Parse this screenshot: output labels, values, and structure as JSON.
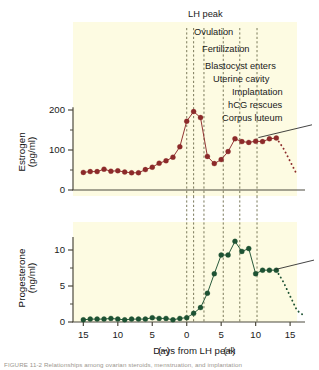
{
  "figure": {
    "background": "#fdfbe2",
    "page_background": "#ffffff",
    "estrogen_color": "#8c2a2a",
    "progesterone_color": "#1d5233",
    "axis_color": "#4d4a3e",
    "annotation_color": "#1a1a1a"
  },
  "annotations": [
    {
      "id": "lh-peak",
      "label": "LH peak",
      "day": 0.0
    },
    {
      "id": "ovulation",
      "label": "Ovulation",
      "day": 1.0
    },
    {
      "id": "fertilization",
      "label": "Fertilization",
      "day": 2.5
    },
    {
      "id": "blastocyst",
      "label": "Blastocyst enters",
      "day": 5.3
    },
    {
      "id": "uterine-cavity",
      "label": "Uterine cavity",
      "day": 5.3
    },
    {
      "id": "implantation",
      "label": "Implantation",
      "day": 7.7
    },
    {
      "id": "hcg-rescues",
      "label": "hCG rescues",
      "day": 10.2
    },
    {
      "id": "corpus-luteum",
      "label": "Corpus luteum",
      "day": 10.2
    }
  ],
  "xaxis": {
    "label_main": "Days from LH peak",
    "label_minus": "(−)",
    "label_plus": "(+)",
    "ticks": [
      {
        "value": -15,
        "text": "15"
      },
      {
        "value": -10,
        "text": "10"
      },
      {
        "value": -5,
        "text": "5"
      },
      {
        "value": 0,
        "text": "0"
      },
      {
        "value": 5,
        "text": "5"
      },
      {
        "value": 10,
        "text": "10"
      },
      {
        "value": 15,
        "text": "15"
      }
    ],
    "range": [
      -16.5,
      16.0
    ]
  },
  "chart_data": [
    {
      "id": "estrogen-panel",
      "type": "line",
      "title": "",
      "xlabel": "Days from LH peak",
      "ylabel": "Estrogen (pg/ml)",
      "ylabel_lines": [
        "Estrogen",
        "(pg/ml)"
      ],
      "series_name": "Estrogen",
      "color": "#8c2a2a",
      "ylim": [
        0,
        215
      ],
      "yticks": [
        0,
        100,
        200
      ],
      "ytick_labels": [
        "0",
        "100",
        "200"
      ],
      "grid": false,
      "legend": "none",
      "x": [
        -15,
        -14,
        -13,
        -12,
        -11,
        -10,
        -9,
        -8,
        -7,
        -6,
        -5,
        -4,
        -3,
        -2,
        -1,
        0,
        1,
        2,
        3,
        4,
        5,
        6,
        7,
        8,
        9,
        10,
        11,
        12,
        13
      ],
      "values": [
        44,
        46,
        46,
        52,
        47,
        48,
        45,
        43,
        43,
        51,
        57,
        67,
        73,
        82,
        108,
        172,
        196,
        181,
        84,
        66,
        76,
        96,
        128,
        121,
        119,
        122,
        121,
        128,
        130
      ],
      "dotted_tail": {
        "x": [
          13,
          14,
          15,
          16
        ],
        "values": [
          130,
          105,
          72,
          38
        ],
        "style": "dotted"
      }
    },
    {
      "id": "progesterone-panel",
      "type": "line",
      "title": "",
      "xlabel": "Days from LH peak",
      "ylabel": "Progesterone (ng/ml)",
      "ylabel_lines": [
        "Progesterone",
        "(ng/ml)"
      ],
      "series_name": "Progesterone",
      "color": "#1d5233",
      "ylim": [
        0,
        12.2
      ],
      "yticks": [
        0,
        5,
        10
      ],
      "ytick_labels": [
        "0",
        "5",
        "10"
      ],
      "yticks_minor": [
        2.5,
        7.5
      ],
      "grid": false,
      "legend": "none",
      "x": [
        -15,
        -14,
        -13,
        -12,
        -11,
        -10,
        -9,
        -8,
        -7,
        -6,
        -5,
        -4,
        -3,
        -2,
        -1,
        0,
        1,
        2,
        3,
        4,
        5,
        6,
        7,
        8,
        9,
        10,
        11,
        12,
        13
      ],
      "values": [
        0.3,
        0.4,
        0.4,
        0.4,
        0.5,
        0.4,
        0.3,
        0.4,
        0.4,
        0.4,
        0.6,
        0.5,
        0.5,
        0.3,
        0.5,
        0.6,
        1.2,
        2.0,
        4.0,
        6.7,
        9.3,
        9.3,
        11.2,
        9.8,
        10.2,
        6.7,
        7.2,
        7.2,
        7.2
      ],
      "dotted_tail": {
        "x": [
          13,
          14,
          15,
          16,
          17
        ],
        "values": [
          7.2,
          5.6,
          3.6,
          1.6,
          0.9
        ],
        "style": "dotted"
      }
    }
  ],
  "caption": {
    "text": "FIGURE 11-2 Relationships among ovarian steroids, menstruation, and implantation"
  }
}
